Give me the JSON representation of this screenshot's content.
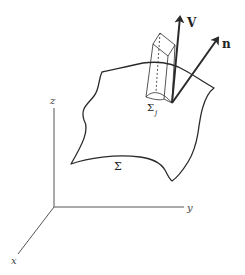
{
  "diagram": {
    "type": "surface-flux-illustration",
    "axes": {
      "x_label": "x",
      "y_label": "y",
      "z_label": "z"
    },
    "surface": {
      "label": "Σ"
    },
    "patch": {
      "label": "Σ",
      "subscript": "j"
    },
    "vectors": [
      {
        "name": "velocity",
        "label": "V"
      },
      {
        "name": "normal",
        "label": "n"
      }
    ],
    "colors": {
      "stroke": "#2a2a2a",
      "axis": "#555555",
      "background": "#ffffff"
    }
  }
}
